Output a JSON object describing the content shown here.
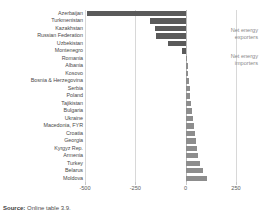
{
  "chart_data": {
    "type": "bar",
    "orientation": "horizontal",
    "title": "",
    "subtitle": "",
    "xlabel": "",
    "ylabel": "",
    "xlim": [
      -500,
      300
    ],
    "xticks": [
      -500,
      -250,
      0,
      250
    ],
    "xticklabels": [
      "-500",
      "-250",
      "0",
      "250"
    ],
    "grid": true,
    "legend_position": "none",
    "categories": [
      "Azerbaijan",
      "Turkmenistan",
      "Kazakhstan",
      "Russian Federation",
      "Uzbekistan",
      "Montenegro",
      "Romania",
      "Albania",
      "Kosovo",
      "Bosnia & Herzegovina",
      "Serbia",
      "Poland",
      "Tajikistan",
      "Bulgaria",
      "Ukraine",
      "Macedonia, FYR",
      "Croatia",
      "Georgia",
      "Kyrgyz Rep.",
      "Armenia",
      "Turkey",
      "Belarus",
      "Moldova"
    ],
    "values": [
      -490,
      -175,
      -153,
      -148,
      -88,
      -20,
      8,
      12,
      14,
      16,
      20,
      24,
      28,
      32,
      37,
      41,
      46,
      52,
      58,
      63,
      72,
      86,
      104
    ],
    "groups": [
      "exporter",
      "exporter",
      "exporter",
      "exporter",
      "exporter",
      "exporter",
      "importer",
      "importer",
      "importer",
      "importer",
      "importer",
      "importer",
      "importer",
      "importer",
      "importer",
      "importer",
      "importer",
      "importer",
      "importer",
      "importer",
      "importer",
      "importer",
      "importer"
    ],
    "annotations": [
      {
        "name": "net-energy-exporters",
        "text": "Net energy\nexporters",
        "line1": "Net energy",
        "line2": "exporters"
      },
      {
        "name": "net-energy-importers",
        "text": "Net energy\nimporters",
        "line1": "Net energy",
        "line2": "importers"
      }
    ]
  },
  "annotations": {
    "exporters": {
      "line1": "Net energy",
      "line2": "exporters"
    },
    "importers": {
      "line1": "Net energy",
      "line2": "importers"
    }
  },
  "source": {
    "label": "Source:",
    "text": "Online table 3.9."
  },
  "colors": {
    "bar_exporter": "#5a5a5a",
    "bar_importer": "#8d8d8d",
    "gridline": "#d8d8d8",
    "band": "#f4f4f4",
    "text": "#4a4a4a",
    "annotation_text": "#8a8a8a"
  }
}
